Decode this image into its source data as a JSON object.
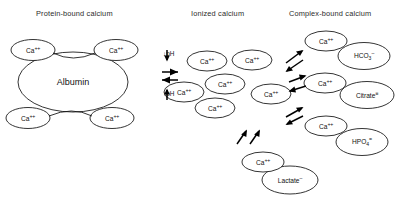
{
  "diagram": {
    "type": "equilibrium-diagram",
    "background": "#ffffff",
    "stroke_color": "#111111"
  },
  "headers": [
    {
      "id": "protein-bound",
      "label": "Protein-bound calcium",
      "x": 36,
      "y": 9
    },
    {
      "id": "ionized",
      "label": "Ionized calcium",
      "x": 191,
      "y": 9
    },
    {
      "id": "complex-bound",
      "label": "Complex-bound calcium",
      "x": 289,
      "y": 9
    }
  ],
  "columns": {
    "protein_bound": {
      "carrier": {
        "label": "Albumin",
        "cx": 73,
        "cy": 82,
        "rx": 55,
        "ry": 30
      },
      "calcium_ions": [
        {
          "label": "Ca",
          "charge": "++",
          "cx": 33,
          "cy": 50,
          "rx": 22,
          "ry": 10.5
        },
        {
          "label": "Ca",
          "charge": "++",
          "cx": 116,
          "cy": 50,
          "rx": 22,
          "ry": 10.5
        },
        {
          "label": "Ca",
          "charge": "++",
          "cx": 28,
          "cy": 118,
          "rx": 22,
          "ry": 10.5
        },
        {
          "label": "Ca",
          "charge": "++",
          "cx": 112,
          "cy": 118,
          "rx": 22,
          "ry": 10.5
        }
      ]
    },
    "ionized": {
      "calcium_ions": [
        {
          "label": "Ca",
          "charge": "++",
          "cx": 207,
          "cy": 61,
          "rx": 20,
          "ry": 10
        },
        {
          "label": "Ca",
          "charge": "++",
          "cx": 252,
          "cy": 60,
          "rx": 20,
          "ry": 10
        },
        {
          "label": "Ca",
          "charge": "++",
          "cx": 225,
          "cy": 84,
          "rx": 20,
          "ry": 10
        },
        {
          "label": "Ca",
          "charge": "++",
          "cx": 184,
          "cy": 92,
          "rx": 20,
          "ry": 10
        },
        {
          "label": "Ca",
          "charge": "++",
          "cx": 271,
          "cy": 94,
          "rx": 20,
          "ry": 10
        },
        {
          "label": "Ca",
          "charge": "++",
          "cx": 215,
          "cy": 108,
          "rx": 20,
          "ry": 10
        }
      ]
    },
    "complex_bound": {
      "pairs": [
        {
          "id": "bicarbonate",
          "cation": {
            "label": "Ca",
            "charge": "++",
            "cx": 326,
            "cy": 41,
            "rx": 21,
            "ry": 10
          },
          "anion": {
            "label": "HCO",
            "sub": "3",
            "charge": "–",
            "cx": 364,
            "cy": 56,
            "rx": 26,
            "ry": 13.5
          }
        },
        {
          "id": "citrate",
          "cation": {
            "label": "Ca",
            "charge": "++",
            "cx": 325,
            "cy": 83,
            "rx": 21,
            "ry": 10
          },
          "anion": {
            "label": "Citrate",
            "sub": "",
            "charge": "≡",
            "cx": 367,
            "cy": 95,
            "rx": 27,
            "ry": 13.5
          }
        },
        {
          "id": "phosphate",
          "cation": {
            "label": "Ca",
            "charge": "++",
            "cx": 326,
            "cy": 126,
            "rx": 21,
            "ry": 10
          },
          "anion": {
            "label": "HPO",
            "sub": "4",
            "charge": "=",
            "cx": 362,
            "cy": 142,
            "rx": 26,
            "ry": 13.5
          }
        },
        {
          "id": "lactate",
          "cation": {
            "label": "Ca",
            "charge": "++",
            "cx": 263,
            "cy": 162,
            "rx": 21,
            "ry": 10
          },
          "anion": {
            "label": "Lactate",
            "sub": "",
            "charge": "–",
            "cx": 290,
            "cy": 180,
            "rx": 28,
            "ry": 14
          }
        }
      ]
    }
  },
  "equilibria": {
    "protein_to_ionized": {
      "type": "vertical-double-arrow",
      "x": 168,
      "upper_label": "↓pH",
      "lower_label": "↑pH",
      "upper_label_pos": {
        "x": 163,
        "y": 56
      },
      "lower_label_pos": {
        "x": 163,
        "y": 96
      }
    },
    "ionized_to_complex": [
      {
        "id": "to-bicarbonate",
        "type": "diagonal-double-arrow",
        "x": 293,
        "y": 57
      },
      {
        "id": "to-citrate",
        "type": "diagonal-double-arrow",
        "x": 296,
        "y": 82
      },
      {
        "id": "to-phosphate",
        "type": "diagonal-double-arrow",
        "x": 293,
        "y": 112
      },
      {
        "id": "to-lactate",
        "type": "diagonal-double-arrow",
        "x": 243,
        "y": 136
      }
    ]
  }
}
